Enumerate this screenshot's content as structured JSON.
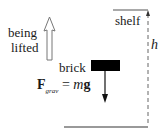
{
  "diagram": {
    "motion_label": {
      "line1": "being",
      "line2": "lifted"
    },
    "shelf_label": "shelf",
    "height_label": "h",
    "object_label": "brick",
    "force": {
      "symbol": "F",
      "subscript": "grav",
      "equals": "=",
      "mass": "m",
      "accel": "g"
    },
    "colors": {
      "line": "#555555",
      "brick": "#000000",
      "text": "#1a1a1a",
      "background": "#ffffff"
    }
  }
}
